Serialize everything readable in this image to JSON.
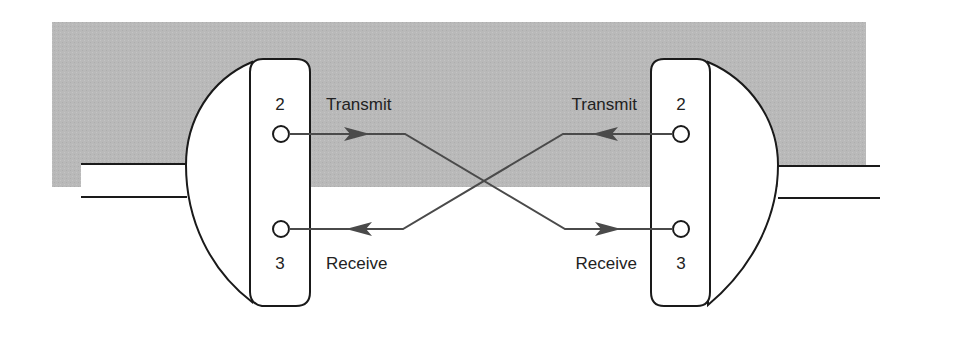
{
  "diagram": {
    "colors": {
      "panel": "#b9b9b9",
      "connector_fill": "#ffffff",
      "outline": "#1a1a1a",
      "wire": "#4a4a4a"
    },
    "left_connector": {
      "pin_top_number": "2",
      "pin_bottom_number": "3",
      "top_label": "Transmit",
      "bottom_label": "Receive"
    },
    "right_connector": {
      "pin_top_number": "2",
      "pin_bottom_number": "3",
      "top_label": "Transmit",
      "bottom_label": "Receive"
    },
    "connections": [
      {
        "from": "left pin 2 (Transmit)",
        "to": "right pin 3 (Receive)"
      },
      {
        "from": "right pin 2 (Transmit)",
        "to": "left pin 3 (Receive)"
      }
    ]
  }
}
